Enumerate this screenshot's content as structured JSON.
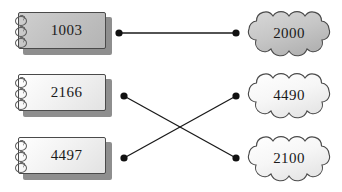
{
  "diagram": {
    "type": "bipartite-matching",
    "background": "#ffffff",
    "line_color": "#1a1a1a",
    "dot_color": "#111111",
    "shaded_fill": "#c2c2c2",
    "plain_fill": "#f3f3f3",
    "left_nodes": [
      {
        "id": "L1",
        "label": "1003",
        "shape": "notepad",
        "shaded": true,
        "x": 18,
        "y": 12
      },
      {
        "id": "L2",
        "label": "2166",
        "shape": "notepad",
        "shaded": false,
        "x": 18,
        "y": 74
      },
      {
        "id": "L3",
        "label": "4497",
        "shape": "notepad",
        "shaded": false,
        "x": 18,
        "y": 137
      }
    ],
    "right_nodes": [
      {
        "id": "R1",
        "label": "2000",
        "shape": "cloud",
        "shaded": true,
        "x": 243,
        "y": 9
      },
      {
        "id": "R2",
        "label": "4490",
        "shape": "cloud",
        "shaded": false,
        "x": 243,
        "y": 71
      },
      {
        "id": "R3",
        "label": "2100",
        "shape": "cloud",
        "shaded": false,
        "x": 243,
        "y": 134
      }
    ],
    "dots": [
      {
        "id": "d-L1",
        "x": 119,
        "y": 33
      },
      {
        "id": "d-R1",
        "x": 236,
        "y": 33
      },
      {
        "id": "d-L2",
        "x": 124,
        "y": 96
      },
      {
        "id": "d-R2",
        "x": 236,
        "y": 96
      },
      {
        "id": "d-L3",
        "x": 124,
        "y": 158
      },
      {
        "id": "d-R3",
        "x": 236,
        "y": 158
      }
    ],
    "edges": [
      {
        "id": "e1",
        "from": "L1",
        "to": "R1",
        "x1": 119,
        "y1": 33,
        "x2": 236,
        "y2": 33
      },
      {
        "id": "e2",
        "from": "L2",
        "to": "R3",
        "x1": 124,
        "y1": 96,
        "x2": 236,
        "y2": 158
      },
      {
        "id": "e3",
        "from": "L3",
        "to": "R2",
        "x1": 124,
        "y1": 158,
        "x2": 236,
        "y2": 96
      }
    ]
  }
}
